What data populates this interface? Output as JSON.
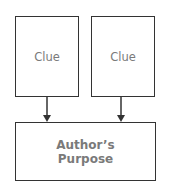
{
  "diagram": {
    "nodes": [
      {
        "id": "clue1",
        "label": "Clue"
      },
      {
        "id": "clue2",
        "label": "Clue"
      },
      {
        "id": "purpose",
        "label_line1": "Author’s",
        "label_line2": "Purpose"
      }
    ],
    "edges": [
      {
        "from": "clue1",
        "to": "purpose"
      },
      {
        "from": "clue2",
        "to": "purpose"
      }
    ],
    "colors": {
      "border": "#333333",
      "text": "#7a7a7a"
    }
  }
}
